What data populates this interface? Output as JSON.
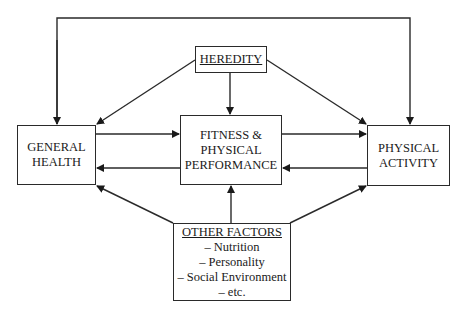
{
  "diagram": {
    "nodes": {
      "heredity": {
        "label": "HEREDITY",
        "underlined": true
      },
      "general_health": {
        "line1": "GENERAL",
        "line2": "HEALTH"
      },
      "fitness": {
        "line1": "FITNESS &",
        "line2": "PHYSICAL",
        "line3": "PERFORMANCE"
      },
      "physical_activity": {
        "line1": "PHYSICAL",
        "line2": "ACTIVITY"
      },
      "other_factors": {
        "title": "OTHER FACTORS",
        "items": [
          "– Nutrition",
          "– Personality",
          "– Social Environment",
          "– etc."
        ]
      }
    },
    "edges": [
      {
        "from": "HEREDITY",
        "to": "GENERAL HEALTH"
      },
      {
        "from": "HEREDITY",
        "to": "FITNESS & PHYSICAL PERFORMANCE"
      },
      {
        "from": "HEREDITY",
        "to": "PHYSICAL ACTIVITY"
      },
      {
        "from": "GENERAL HEALTH",
        "to": "FITNESS & PHYSICAL PERFORMANCE"
      },
      {
        "from": "FITNESS & PHYSICAL PERFORMANCE",
        "to": "GENERAL HEALTH"
      },
      {
        "from": "FITNESS & PHYSICAL PERFORMANCE",
        "to": "PHYSICAL ACTIVITY"
      },
      {
        "from": "PHYSICAL ACTIVITY",
        "to": "FITNESS & PHYSICAL PERFORMANCE"
      },
      {
        "from": "OTHER FACTORS",
        "to": "GENERAL HEALTH"
      },
      {
        "from": "OTHER FACTORS",
        "to": "FITNESS & PHYSICAL PERFORMANCE"
      },
      {
        "from": "OTHER FACTORS",
        "to": "PHYSICAL ACTIVITY"
      },
      {
        "from": "top connector",
        "to": "GENERAL HEALTH"
      },
      {
        "from": "top connector",
        "to": "PHYSICAL ACTIVITY"
      }
    ],
    "colors": {
      "line": "#2a2a2a",
      "background": "#ffffff"
    }
  }
}
